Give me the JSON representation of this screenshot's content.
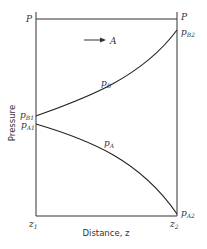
{
  "diagram": {
    "total_pressure_label": "P",
    "flux_label": "A",
    "y_axis_label": "Pressure",
    "x_axis_label": "Distance, z",
    "x_start_label": {
      "main": "z",
      "sub": "1"
    },
    "x_end_label": {
      "main": "z",
      "sub": "2"
    },
    "curves": [
      {
        "name": "p_B",
        "label_main": "p",
        "label_sub": "B",
        "start_label": {
          "main": "p",
          "sub": "B1"
        },
        "end_label": {
          "main": "p",
          "sub": "B2"
        },
        "trend": "increasing"
      },
      {
        "name": "p_A",
        "label_main": "p",
        "label_sub": "A",
        "start_label": {
          "main": "p",
          "sub": "A1"
        },
        "end_label": {
          "main": "p",
          "sub": "A2"
        },
        "trend": "decreasing"
      }
    ],
    "colors": {
      "line": "#222222",
      "background": "#ffffff"
    }
  }
}
